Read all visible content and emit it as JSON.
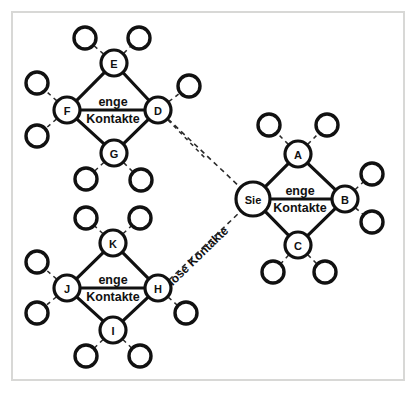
{
  "diagram": {
    "type": "social-network-diagram",
    "language": "de",
    "frame": {
      "x": 11,
      "y": 11,
      "width": 394,
      "height": 370
    },
    "clusters": [
      {
        "id": "cluster-top-left",
        "label_line1": "enge",
        "label_line2": "Kontakte",
        "label_x": 113,
        "label_y": 110,
        "nodes": [
          {
            "id": "E",
            "label": "E",
            "x": 114,
            "y": 63,
            "r": 13
          },
          {
            "id": "F",
            "label": "F",
            "x": 67,
            "y": 110,
            "r": 13
          },
          {
            "id": "D",
            "label": "D",
            "x": 158,
            "y": 110,
            "r": 13
          },
          {
            "id": "G",
            "label": "G",
            "x": 114,
            "y": 153,
            "r": 13
          }
        ],
        "core_edges": [
          [
            "E",
            "F"
          ],
          [
            "E",
            "D"
          ],
          [
            "F",
            "D"
          ],
          [
            "F",
            "G"
          ],
          [
            "D",
            "G"
          ]
        ],
        "pendants": [
          {
            "from": "E",
            "x": 85,
            "y": 38,
            "r": 11
          },
          {
            "from": "E",
            "x": 139,
            "y": 38,
            "r": 11
          },
          {
            "from": "F",
            "x": 37,
            "y": 83,
            "r": 11
          },
          {
            "from": "F",
            "x": 37,
            "y": 136,
            "r": 11
          },
          {
            "from": "D",
            "x": 189,
            "y": 86,
            "r": 11
          },
          {
            "from": "G",
            "x": 86,
            "y": 179,
            "r": 11
          },
          {
            "from": "G",
            "x": 141,
            "y": 180,
            "r": 11
          }
        ]
      },
      {
        "id": "cluster-right",
        "label_line1": "enge",
        "label_line2": "Kontakte",
        "label_x": 300,
        "label_y": 199,
        "nodes": [
          {
            "id": "Sie",
            "label": "Sie",
            "x": 253,
            "y": 199,
            "r": 17
          },
          {
            "id": "A",
            "label": "A",
            "x": 298,
            "y": 154,
            "r": 13
          },
          {
            "id": "B",
            "label": "B",
            "x": 345,
            "y": 199,
            "r": 13
          },
          {
            "id": "C",
            "label": "C",
            "x": 298,
            "y": 245,
            "r": 13
          }
        ],
        "core_edges": [
          [
            "Sie",
            "A"
          ],
          [
            "A",
            "B"
          ],
          [
            "Sie",
            "B"
          ],
          [
            "Sie",
            "C"
          ],
          [
            "B",
            "C"
          ]
        ],
        "pendants": [
          {
            "from": "A",
            "x": 269,
            "y": 125,
            "r": 11
          },
          {
            "from": "A",
            "x": 327,
            "y": 125,
            "r": 11
          },
          {
            "from": "B",
            "x": 372,
            "y": 174,
            "r": 11
          },
          {
            "from": "B",
            "x": 372,
            "y": 222,
            "r": 11
          },
          {
            "from": "C",
            "x": 273,
            "y": 272,
            "r": 11
          },
          {
            "from": "C",
            "x": 325,
            "y": 272,
            "r": 11
          }
        ]
      },
      {
        "id": "cluster-bottom-left",
        "label_line1": "enge",
        "label_line2": "Kontakte",
        "label_x": 113,
        "label_y": 288,
        "nodes": [
          {
            "id": "K",
            "label": "K",
            "x": 113,
            "y": 243,
            "r": 13
          },
          {
            "id": "J",
            "label": "J",
            "x": 67,
            "y": 288,
            "r": 13
          },
          {
            "id": "H",
            "label": "H",
            "x": 158,
            "y": 288,
            "r": 13
          },
          {
            "id": "I",
            "label": "I",
            "x": 113,
            "y": 330,
            "r": 13
          }
        ],
        "core_edges": [
          [
            "K",
            "J"
          ],
          [
            "K",
            "H"
          ],
          [
            "J",
            "H"
          ],
          [
            "J",
            "I"
          ],
          [
            "H",
            "I"
          ]
        ],
        "pendants": [
          {
            "from": "K",
            "x": 86,
            "y": 218,
            "r": 11
          },
          {
            "from": "K",
            "x": 140,
            "y": 218,
            "r": 11
          },
          {
            "from": "J",
            "x": 37,
            "y": 262,
            "r": 11
          },
          {
            "from": "J",
            "x": 37,
            "y": 313,
            "r": 11
          },
          {
            "from": "H",
            "x": 186,
            "y": 313,
            "r": 11
          },
          {
            "from": "I",
            "x": 86,
            "y": 356,
            "r": 11
          },
          {
            "from": "I",
            "x": 140,
            "y": 356,
            "r": 11
          }
        ]
      }
    ],
    "bridges": [
      {
        "id": "bridge-d-sie",
        "from": "D",
        "to": "Sie",
        "x1": 168,
        "y1": 119,
        "x2": 243,
        "y2": 190,
        "label": ""
      },
      {
        "id": "bridge-h-sie",
        "from": "H",
        "to": "Sie",
        "x1": 169,
        "y1": 280,
        "x2": 242,
        "y2": 210,
        "label": "lose Kontakte",
        "label_x": 198,
        "label_y": 256,
        "label_rotation": -44
      }
    ],
    "pendant_extra_dashes": [
      {
        "id": "d-lower-right-stub",
        "x1": 168,
        "y1": 120,
        "x2": 205,
        "y2": 158
      }
    ]
  }
}
